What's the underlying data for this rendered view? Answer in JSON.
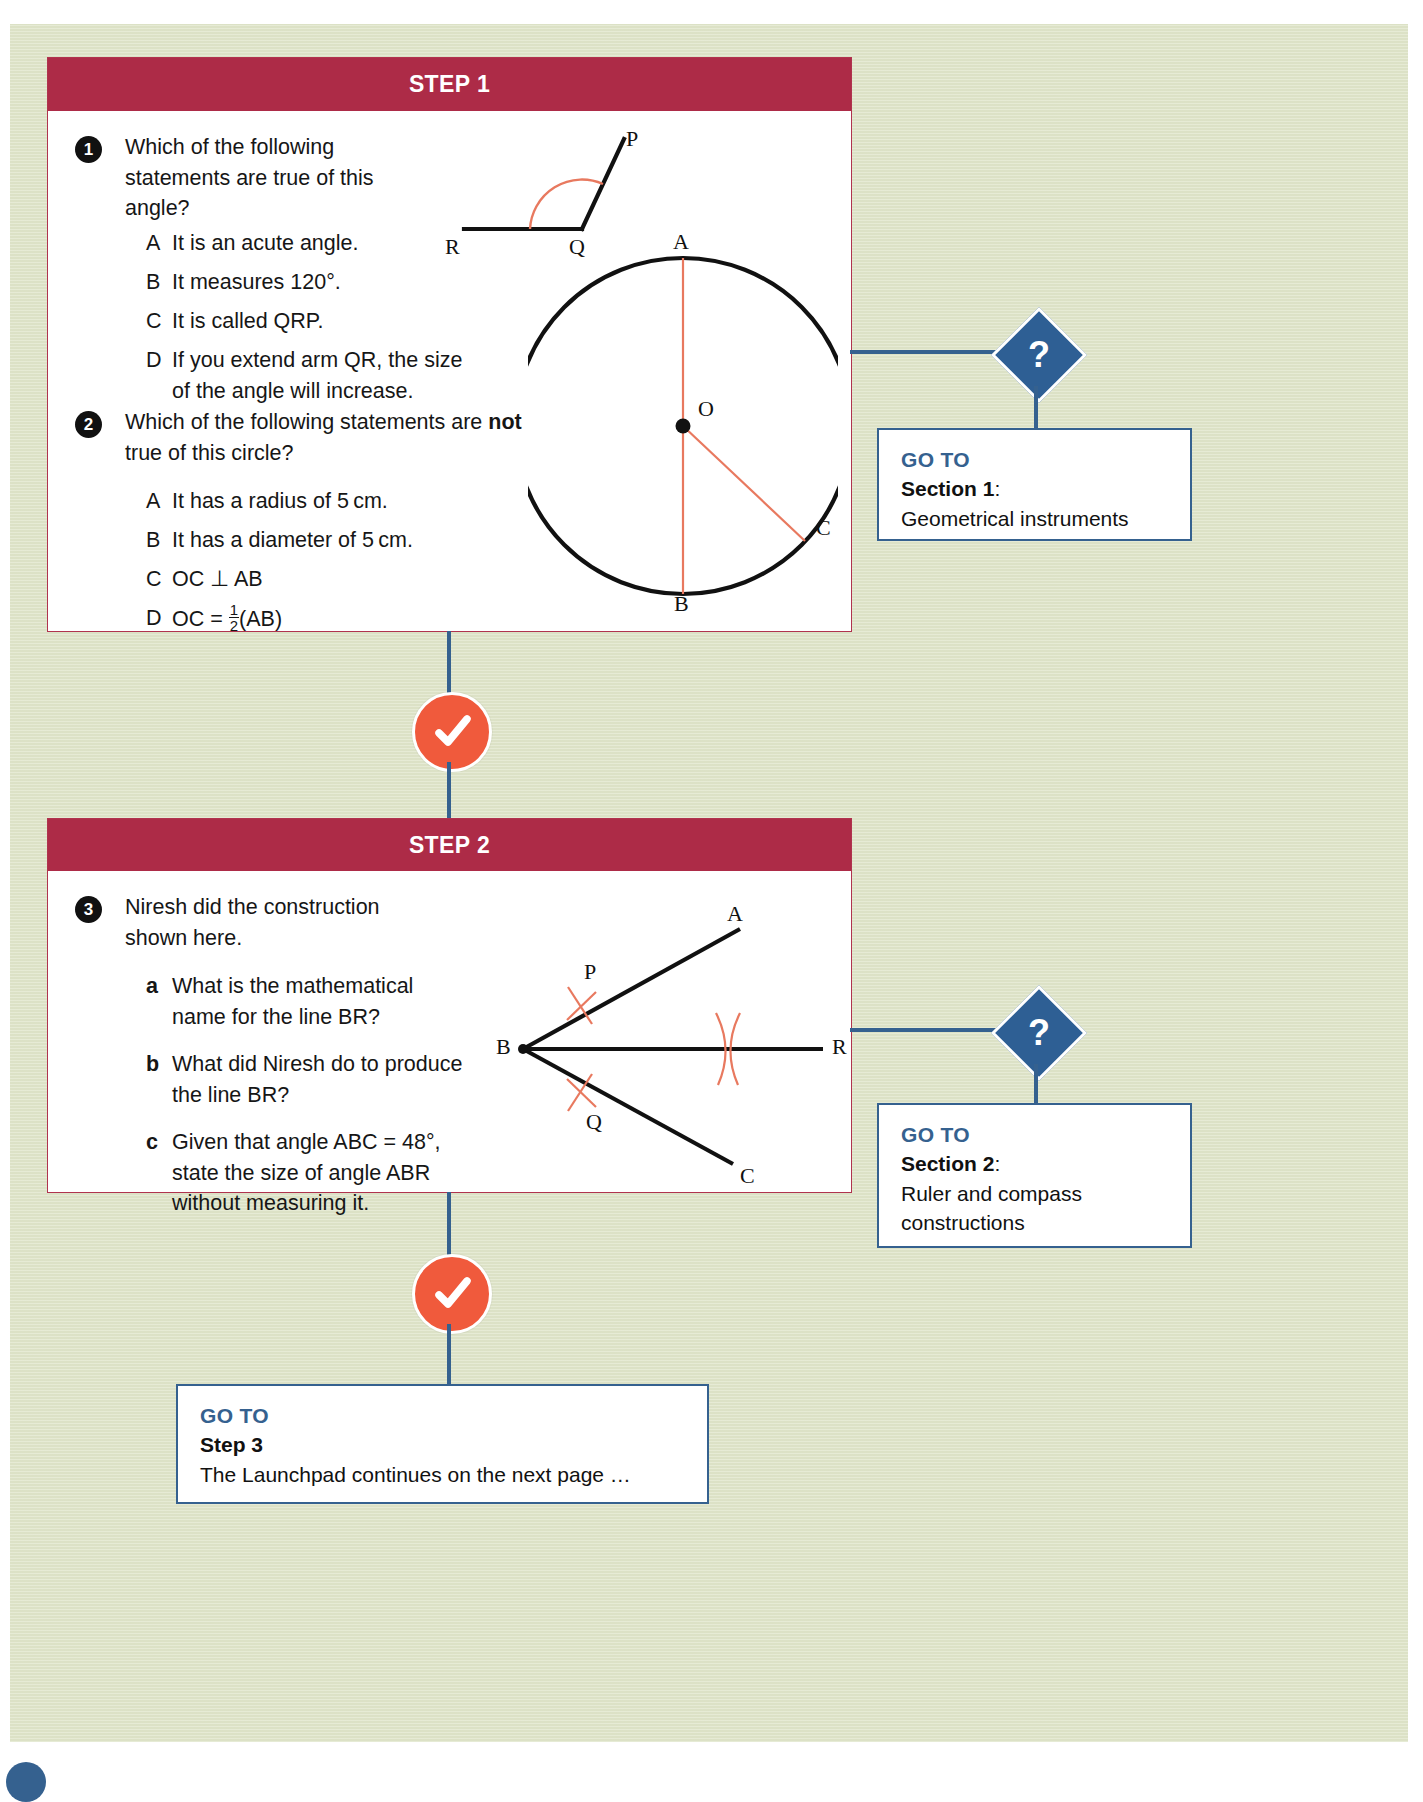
{
  "page": {
    "background_color": "#dfe5c9",
    "accent_crimson": "#ad2b47",
    "accent_blue": "#35618f",
    "accent_orange": "#f05a3c",
    "diagram_red": "#e8795f"
  },
  "steps": [
    {
      "header": "STEP 1",
      "questions": [
        {
          "number": "1",
          "stem": "Which of the following statements are true of this angle?",
          "options": [
            {
              "label": "A",
              "text": "It is an acute angle."
            },
            {
              "label": "B",
              "text": "It measures 120°."
            },
            {
              "label": "C",
              "text": "It is called QRP."
            },
            {
              "label": "D",
              "text": "If you extend arm QR, the size of the angle will increase."
            }
          ]
        },
        {
          "number": "2",
          "stem_before": "Which of the following statements are ",
          "stem_bold": "not",
          "stem_after": " true of this circle?",
          "options": [
            {
              "label": "A",
              "text": "It has a radius of 5 cm."
            },
            {
              "label": "B",
              "text": "It has a diameter of 5 cm."
            },
            {
              "label": "C",
              "text": "OC ⊥ AB"
            },
            {
              "label": "D",
              "text": "OC = ½(AB)",
              "frac_num": "1",
              "frac_den": "2",
              "prefix": "OC = ",
              "suffix": "(AB)"
            }
          ]
        }
      ],
      "diagram_angle": {
        "points": [
          "P",
          "Q",
          "R"
        ],
        "arc_color": "#e8795f"
      },
      "diagram_circle": {
        "points": [
          "A",
          "O",
          "B",
          "C"
        ],
        "line_color": "#e8795f"
      },
      "goto": {
        "goto_label": "GO TO",
        "section_label": "Section 1",
        "section_colon": ":",
        "description": "Geometrical instruments"
      },
      "badge": "?"
    },
    {
      "header": "STEP 2",
      "questions": [
        {
          "number": "3",
          "stem": "Niresh did the construction shown here.",
          "options": [
            {
              "label": "a",
              "text": "What is the mathematical name for the line BR?"
            },
            {
              "label": "b",
              "text": "What did Niresh do to produce the line BR?"
            },
            {
              "label": "c",
              "text": "Given that angle ABC = 48°, state the size of angle ABR without measuring it."
            }
          ]
        }
      ],
      "diagram_construction": {
        "points": [
          "A",
          "P",
          "B",
          "R",
          "Q",
          "C"
        ],
        "arc_color": "#e8795f"
      },
      "goto": {
        "goto_label": "GO TO",
        "section_label": "Section 2",
        "section_colon": ":",
        "description_line1": "Ruler and compass",
        "description_line2": "constructions"
      },
      "badge": "?"
    }
  ],
  "final_goto": {
    "goto_label": "GO TO",
    "step_label": "Step 3",
    "description": "The Launchpad continues on the next page …"
  },
  "icons": {
    "tick": "check-icon",
    "question": "?"
  }
}
